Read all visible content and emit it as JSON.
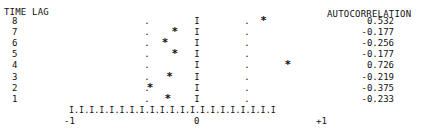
{
  "chart_data": {
    "type": "bar",
    "title": "",
    "xlabel": "",
    "ylabel": "TIME LAG",
    "value_column_label": "AUTOCORRELATION",
    "categories": [
      "8",
      "7",
      "6",
      "5",
      "4",
      "3",
      "2",
      "1"
    ],
    "values": [
      0.532,
      -0.177,
      -0.256,
      -0.177,
      0.726,
      -0.219,
      -0.375,
      -0.233
    ],
    "confidence_band": [
      -0.4,
      0.4
    ],
    "xlim": [
      -1,
      1
    ],
    "x_tick_labels": [
      "-1",
      "0",
      "+1"
    ],
    "axis_string": "I.I.I.I.I.I.I.I.I.I.I.I.I.I.I.I.I.I.I.I.I",
    "center_marker": "I",
    "band_marker": ".",
    "point_marker": "*",
    "grid": false
  },
  "labels": {
    "time_lag": "TIME LAG",
    "autocorrelation": "AUTOCORRELATION",
    "tick_neg1": "-1",
    "tick_0": "0",
    "tick_pos1": "+1"
  },
  "rows": [
    {
      "lag": "8",
      "value": "0.532"
    },
    {
      "lag": "7",
      "value": "-0.177"
    },
    {
      "lag": "6",
      "value": "-0.256"
    },
    {
      "lag": "5",
      "value": "-0.177"
    },
    {
      "lag": "4",
      "value": "0.726"
    },
    {
      "lag": "3",
      "value": "-0.219"
    },
    {
      "lag": "2",
      "value": "-0.375"
    },
    {
      "lag": "1",
      "value": "-0.233"
    }
  ]
}
